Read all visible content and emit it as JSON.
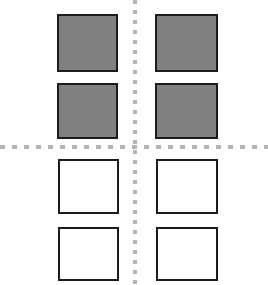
{
  "figure": {
    "canvas_width": 268,
    "canvas_height": 285,
    "background_color": "#ffffff"
  },
  "colors": {
    "filled_square_fill": "#808080",
    "empty_square_fill": "#ffffff",
    "square_border": "#1c1c1c",
    "axis_dash": "#b4b4b4"
  },
  "axes": {
    "vertical": {
      "label": "vertical-dashed-divider",
      "x": 133,
      "y": 0,
      "length": 285,
      "thickness": 4,
      "dash_length": 4,
      "dash_gap": 6,
      "color": "#b4b4b4"
    },
    "horizontal": {
      "label": "horizontal-dashed-divider",
      "x": 0,
      "y": 145,
      "length": 268,
      "thickness": 4,
      "dash_length": 5,
      "dash_gap": 7,
      "color": "#b4b4b4"
    }
  },
  "chart_data": {
    "type": "heatmap",
    "xlabel": "",
    "ylabel": "",
    "columns": [
      "left",
      "right"
    ],
    "rows": [
      "row-1",
      "row-2",
      "row-3",
      "row-4"
    ],
    "legend": [
      {
        "name": "filled",
        "color": "#808080",
        "value": 1
      },
      {
        "name": "empty",
        "color": "#ffffff",
        "value": 0
      }
    ],
    "values": [
      [
        1,
        1
      ],
      [
        1,
        1
      ],
      [
        0,
        0
      ],
      [
        0,
        0
      ]
    ],
    "grid": false,
    "legend_position": "none"
  },
  "squares": [
    {
      "id": "square-r1c1",
      "state": "filled",
      "fill": "#808080",
      "x": 57,
      "y": 14,
      "width": 61,
      "height": 58,
      "quadrant": "top-left"
    },
    {
      "id": "square-r1c2",
      "state": "filled",
      "fill": "#808080",
      "x": 155,
      "y": 14,
      "width": 63,
      "height": 58,
      "quadrant": "top-right"
    },
    {
      "id": "square-r2c1",
      "state": "filled",
      "fill": "#808080",
      "x": 57,
      "y": 83,
      "width": 61,
      "height": 56,
      "quadrant": "top-left"
    },
    {
      "id": "square-r2c2",
      "state": "filled",
      "fill": "#808080",
      "x": 155,
      "y": 83,
      "width": 63,
      "height": 56,
      "quadrant": "top-right"
    },
    {
      "id": "square-r3c1",
      "state": "empty",
      "fill": "#ffffff",
      "x": 58,
      "y": 159,
      "width": 61,
      "height": 55,
      "quadrant": "bottom-left"
    },
    {
      "id": "square-r3c2",
      "state": "empty",
      "fill": "#ffffff",
      "x": 156,
      "y": 159,
      "width": 62,
      "height": 55,
      "quadrant": "bottom-right"
    },
    {
      "id": "square-r4c1",
      "state": "empty",
      "fill": "#ffffff",
      "x": 58,
      "y": 227,
      "width": 61,
      "height": 54,
      "quadrant": "bottom-left"
    },
    {
      "id": "square-r4c2",
      "state": "empty",
      "fill": "#ffffff",
      "x": 156,
      "y": 227,
      "width": 62,
      "height": 54,
      "quadrant": "bottom-right"
    }
  ]
}
